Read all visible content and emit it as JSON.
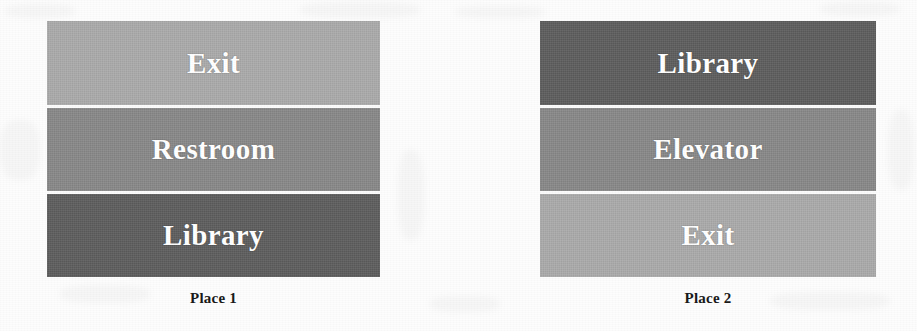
{
  "figure": {
    "background_color": "#fdfdfd",
    "text_color": "#1a1a1a",
    "label_color": "#ffffff",
    "separator_color": "#fbfbfb"
  },
  "panels": [
    {
      "id": "place-1",
      "caption": "Place 1",
      "geometry": {
        "left": 47,
        "top": 21,
        "width": 333,
        "height": 256
      },
      "caption_top": 290,
      "blocks": [
        {
          "label": "Exit",
          "shade": "light",
          "color": "#adadad",
          "height": 84
        },
        {
          "label": "Restroom",
          "shade": "medium",
          "color": "#8a8a8a",
          "height": 86
        },
        {
          "label": "Library",
          "shade": "dark",
          "color": "#5e5e5e",
          "height": 86
        }
      ]
    },
    {
      "id": "place-2",
      "caption": "Place 2",
      "geometry": {
        "left": 540,
        "top": 21,
        "width": 336,
        "height": 256
      },
      "caption_top": 290,
      "blocks": [
        {
          "label": "Library",
          "shade": "dark",
          "color": "#5e5e5e",
          "height": 84
        },
        {
          "label": "Elevator",
          "shade": "medium",
          "color": "#8a8a8a",
          "height": 86
        },
        {
          "label": "Exit",
          "shade": "light",
          "color": "#adadad",
          "height": 86
        }
      ]
    }
  ],
  "scan_artifacts": [
    {
      "left": 5,
      "top": 4,
      "width": 70,
      "height": 14
    },
    {
      "left": 300,
      "top": 2,
      "width": 120,
      "height": 16
    },
    {
      "left": 455,
      "top": 6,
      "width": 90,
      "height": 12
    },
    {
      "left": 820,
      "top": 2,
      "width": 80,
      "height": 14
    },
    {
      "left": 0,
      "top": 120,
      "width": 40,
      "height": 60
    },
    {
      "left": 398,
      "top": 150,
      "width": 26,
      "height": 90
    },
    {
      "left": 888,
      "top": 110,
      "width": 26,
      "height": 80
    },
    {
      "left": 60,
      "top": 285,
      "width": 90,
      "height": 18
    },
    {
      "left": 430,
      "top": 296,
      "width": 70,
      "height": 16
    },
    {
      "left": 770,
      "top": 292,
      "width": 120,
      "height": 18
    }
  ]
}
